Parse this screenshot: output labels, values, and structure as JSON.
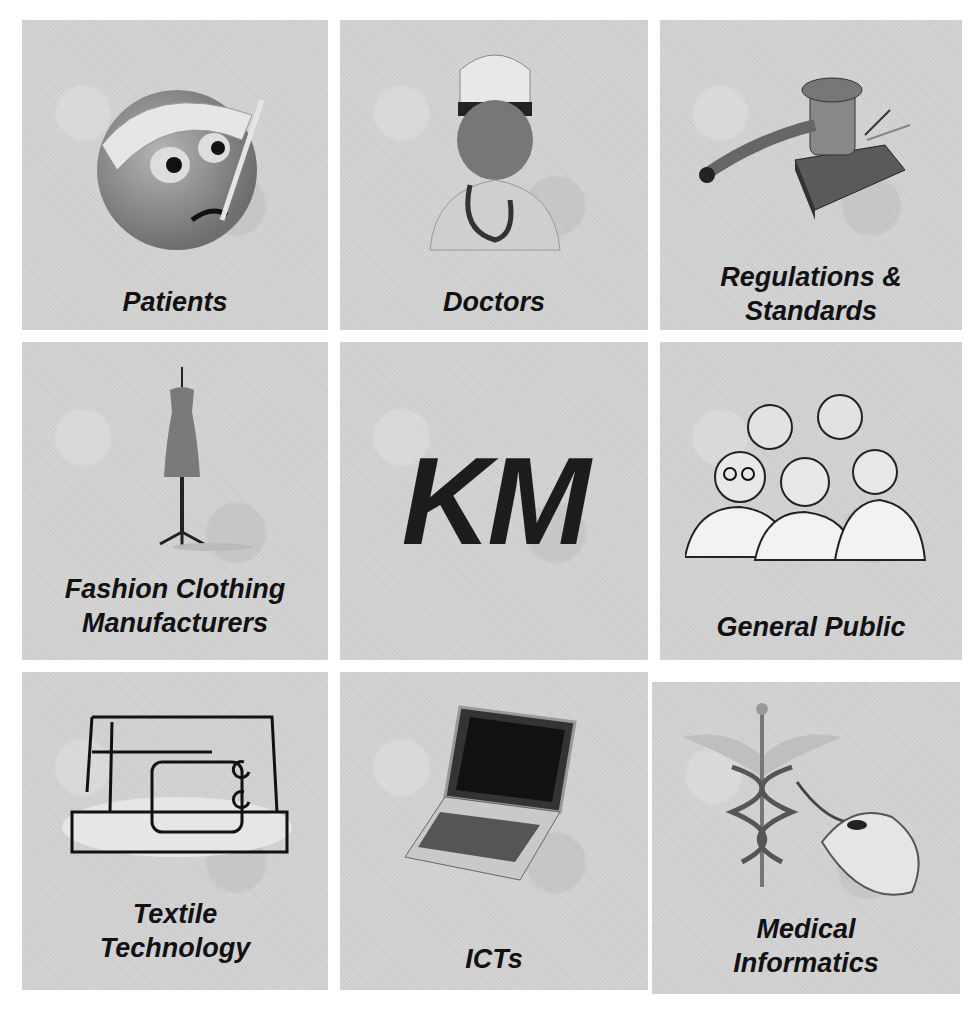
{
  "center": {
    "label": "KM"
  },
  "tiles": [
    {
      "label": "Patients",
      "icon": "sick-face-thermometer-icon"
    },
    {
      "label": "Doctors",
      "icon": "doctor-stethoscope-icon"
    },
    {
      "label": "Regulations & Standards",
      "icon": "gavel-icon"
    },
    {
      "label": "Fashion Clothing Manufacturers",
      "icon": "dress-mannequin-icon"
    },
    {
      "label": "General Public",
      "icon": "people-group-icon"
    },
    {
      "label": "Textile Technology",
      "icon": "sewing-machine-icon"
    },
    {
      "label": "ICTs",
      "icon": "laptop-icon"
    },
    {
      "label": "Medical Informatics",
      "icon": "caduceus-mouse-icon"
    }
  ]
}
